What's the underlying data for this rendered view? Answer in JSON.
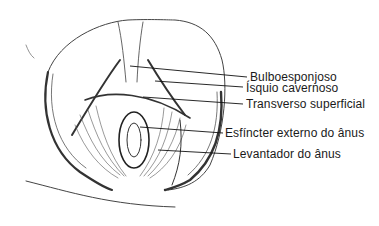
{
  "figure": {
    "labels": [
      {
        "id": "bulboesponjoso",
        "text": "Bulboesponjoso"
      },
      {
        "id": "isquio-cavernoso",
        "text": "Ísquio cavernoso"
      },
      {
        "id": "transverso-superficial",
        "text": "Transverso superficial"
      },
      {
        "id": "esfincter-externo",
        "text": "Esfíncter externo do ânus"
      },
      {
        "id": "levantador",
        "text": "Levantador do ânus"
      }
    ],
    "ink_color": "#222222"
  }
}
